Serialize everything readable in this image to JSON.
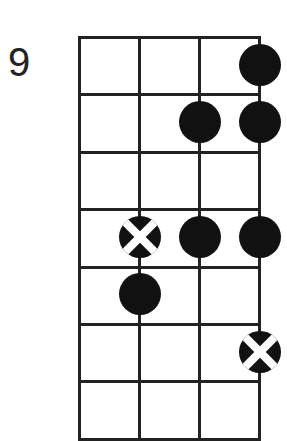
{
  "diagram": {
    "type": "fretboard-scale-diagram",
    "starting_fret_label": "9",
    "strings": 4,
    "frets_visible": 7,
    "colors": {
      "line": "#222222",
      "dot": "#111111",
      "root_marker_cross": "#ffffff",
      "background": "#ffffff"
    },
    "notes": [
      {
        "fret_row": 1,
        "string": 4,
        "type": "note"
      },
      {
        "fret_row": 2,
        "string": 3,
        "type": "note"
      },
      {
        "fret_row": 2,
        "string": 4,
        "type": "note"
      },
      {
        "fret_row": 4,
        "string": 2,
        "type": "root"
      },
      {
        "fret_row": 4,
        "string": 3,
        "type": "note"
      },
      {
        "fret_row": 4,
        "string": 4,
        "type": "note"
      },
      {
        "fret_row": 5,
        "string": 2,
        "type": "note"
      },
      {
        "fret_row": 6,
        "string": 4,
        "type": "root"
      }
    ]
  }
}
